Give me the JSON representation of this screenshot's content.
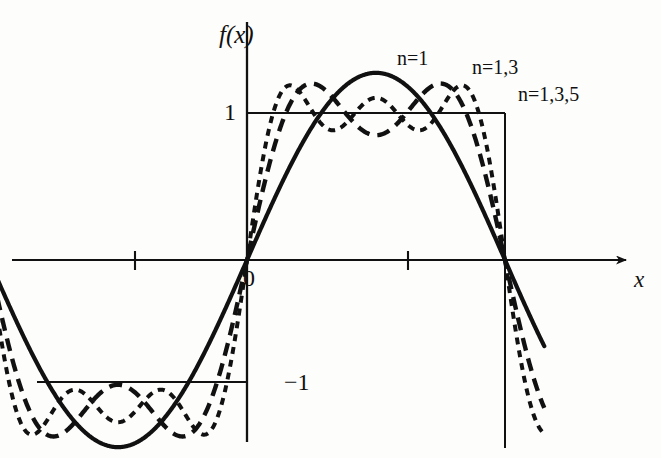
{
  "figure": {
    "background_color": "#fdfdfc",
    "ink_color": "#111111",
    "width": 661,
    "height": 458
  },
  "axes": {
    "ylabel": "f(x)",
    "xlabel": "x",
    "origin_label": "0",
    "y_tick_top_label": "1",
    "y_tick_bottom_label": "−1"
  },
  "annotations": {
    "n1": "n=1",
    "n13": "n=1,3",
    "n135": "n=1,3,5"
  },
  "chart_data": {
    "type": "line",
    "title": "",
    "subtitle": "",
    "xlabel": "x",
    "ylabel": "f(x)",
    "xlim": [
      -3.6,
      4.6
    ],
    "ylim": [
      -1.75,
      1.75
    ],
    "grid": false,
    "legend_position": "inline-annotations",
    "x_ticks": [
      -3.141592653589793,
      0,
      3.141592653589793
    ],
    "x_tick_labels": [
      "",
      "0",
      ""
    ],
    "y_ticks": [
      -1,
      1
    ],
    "y_tick_labels": [
      "−1",
      "1"
    ],
    "reference_lines": [
      {
        "name": "square-wave-positive",
        "y": 1,
        "x_from": 0,
        "x_to": 3.141592653589793,
        "style": "solid"
      },
      {
        "name": "square-wave-negative",
        "y": -1,
        "x_from": -3.141592653589793,
        "x_to": 0,
        "style": "solid"
      },
      {
        "name": "square-wave-jump",
        "x": 3.141592653589793,
        "y_from": 1,
        "y_to": -1.55,
        "style": "solid"
      }
    ],
    "series": [
      {
        "name": "n=1",
        "label": "n=1",
        "style": "solid",
        "formula": "(4/pi) * sin(x)",
        "terms": [
          1
        ],
        "amplitude_peak": 1.273,
        "sample_x": [
          -3.1416,
          -2.618,
          -2.0944,
          -1.5708,
          -1.0472,
          -0.5236,
          0,
          0.5236,
          1.0472,
          1.5708,
          2.0944,
          2.618,
          3.1416
        ],
        "sample_y": [
          0,
          -0.637,
          -1.103,
          -1.273,
          -1.103,
          -0.637,
          0,
          0.637,
          1.103,
          1.273,
          1.103,
          0.637,
          0
        ]
      },
      {
        "name": "n=1,3",
        "label": "n=1,3",
        "style": "dashed-long",
        "formula": "(4/pi) * (sin(x) + sin(3x)/3)",
        "terms": [
          1,
          3
        ],
        "amplitude_peak": 1.18,
        "sample_x": [
          -3.1416,
          -2.618,
          -2.0944,
          -1.5708,
          -1.0472,
          -0.5236,
          0,
          0.5236,
          1.0472,
          1.5708,
          2.0944,
          2.618,
          3.1416
        ],
        "sample_y": [
          0,
          -1.061,
          -0.735,
          -0.849,
          -0.735,
          -1.061,
          0,
          1.061,
          0.735,
          0.849,
          0.735,
          1.061,
          0
        ]
      },
      {
        "name": "n=1,3,5",
        "label": "n=1,3,5",
        "style": "dashed-short",
        "formula": "(4/pi) * (sin(x) + sin(3x)/3 + sin(5x)/5)",
        "terms": [
          1,
          3,
          5
        ],
        "amplitude_peak": 1.14,
        "sample_x": [
          -3.1416,
          -2.618,
          -2.0944,
          -1.5708,
          -1.0472,
          -0.5236,
          0,
          0.5236,
          1.0472,
          1.5708,
          2.0944,
          2.618,
          3.1416
        ],
        "sample_y": [
          0,
          -0.806,
          -0.99,
          -1.104,
          -0.99,
          -0.806,
          0,
          0.806,
          0.99,
          1.104,
          0.99,
          0.806,
          0
        ]
      }
    ]
  }
}
